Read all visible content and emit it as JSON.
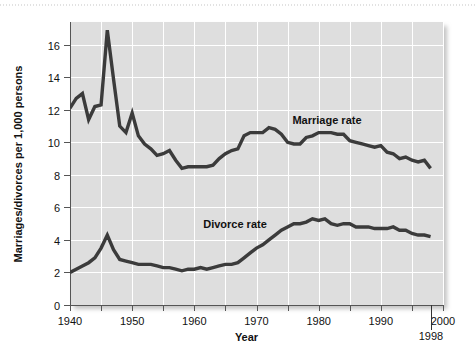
{
  "figure": {
    "background_color": "#ffffff",
    "plot_background_color": "#dedede",
    "gridline_color": "#ffffff",
    "line_color": "#3a3a3a",
    "axis_color": "#555555"
  },
  "labels": {
    "ylabel": "Marriages/divorces per 1,000 persons",
    "xlabel": "Year",
    "marriage_series_label": "Marriage rate",
    "divorce_series_label": "Divorce rate",
    "end_year_callout": "1998"
  },
  "axes": {
    "x_ticks": [
      "1940",
      "1950",
      "1960",
      "1970",
      "1980",
      "1990",
      "2000"
    ],
    "y_ticks": [
      "0",
      "2",
      "4",
      "6",
      "8",
      "10",
      "12",
      "14",
      "16"
    ],
    "x_min": 1940,
    "x_max": 2000,
    "y_min": 0,
    "y_max": 17.4,
    "x_minor_tick_step": 5,
    "y_tick_step": 2
  },
  "chart_data": {
    "type": "line",
    "title": "",
    "xlabel": "Year",
    "ylabel": "Marriages/divorces per 1,000 persons",
    "xlim": [
      1940,
      2000
    ],
    "ylim": [
      0,
      17.4
    ],
    "grid": true,
    "legend": "inline-annotations",
    "annotations": [
      {
        "text": "Marriage rate",
        "x": 1981,
        "y": 11.6
      },
      {
        "text": "Divorce rate",
        "x": 1971,
        "y": 4.9
      },
      {
        "text": "1998",
        "x": 1998,
        "y": -1.6
      }
    ],
    "series": [
      {
        "name": "Marriage rate",
        "x": [
          1940,
          1941,
          1942,
          1943,
          1944,
          1945,
          1946,
          1947,
          1948,
          1949,
          1950,
          1951,
          1952,
          1953,
          1954,
          1955,
          1956,
          1957,
          1958,
          1959,
          1960,
          1961,
          1962,
          1963,
          1964,
          1965,
          1966,
          1967,
          1968,
          1969,
          1970,
          1971,
          1972,
          1973,
          1974,
          1975,
          1976,
          1977,
          1978,
          1979,
          1980,
          1981,
          1982,
          1983,
          1984,
          1985,
          1986,
          1987,
          1988,
          1989,
          1990,
          1991,
          1992,
          1993,
          1994,
          1995,
          1996,
          1997,
          1998
        ],
        "y": [
          12.1,
          12.7,
          13.0,
          11.4,
          12.2,
          12.3,
          16.9,
          13.9,
          11.0,
          10.6,
          11.8,
          10.4,
          9.9,
          9.6,
          9.2,
          9.3,
          9.5,
          8.9,
          8.4,
          8.5,
          8.5,
          8.5,
          8.5,
          8.6,
          9.0,
          9.3,
          9.5,
          9.6,
          10.4,
          10.6,
          10.6,
          10.6,
          10.9,
          10.8,
          10.5,
          10.0,
          9.9,
          9.9,
          10.3,
          10.4,
          10.6,
          10.6,
          10.6,
          10.5,
          10.5,
          10.1,
          10.0,
          9.9,
          9.8,
          9.7,
          9.8,
          9.4,
          9.3,
          9.0,
          9.1,
          8.9,
          8.8,
          8.9,
          8.4
        ]
      },
      {
        "name": "Divorce rate",
        "x": [
          1940,
          1941,
          1942,
          1943,
          1944,
          1945,
          1946,
          1947,
          1948,
          1949,
          1950,
          1951,
          1952,
          1953,
          1954,
          1955,
          1956,
          1957,
          1958,
          1959,
          1960,
          1961,
          1962,
          1963,
          1964,
          1965,
          1966,
          1967,
          1968,
          1969,
          1970,
          1971,
          1972,
          1973,
          1974,
          1975,
          1976,
          1977,
          1978,
          1979,
          1980,
          1981,
          1982,
          1983,
          1984,
          1985,
          1986,
          1987,
          1988,
          1989,
          1990,
          1991,
          1992,
          1993,
          1994,
          1995,
          1996,
          1997,
          1998
        ],
        "y": [
          2.0,
          2.2,
          2.4,
          2.6,
          2.9,
          3.5,
          4.3,
          3.4,
          2.8,
          2.7,
          2.6,
          2.5,
          2.5,
          2.5,
          2.4,
          2.3,
          2.3,
          2.2,
          2.1,
          2.2,
          2.2,
          2.3,
          2.2,
          2.3,
          2.4,
          2.5,
          2.5,
          2.6,
          2.9,
          3.2,
          3.5,
          3.7,
          4.0,
          4.3,
          4.6,
          4.8,
          5.0,
          5.0,
          5.1,
          5.3,
          5.2,
          5.3,
          5.0,
          4.9,
          5.0,
          5.0,
          4.8,
          4.8,
          4.8,
          4.7,
          4.7,
          4.7,
          4.8,
          4.6,
          4.6,
          4.4,
          4.3,
          4.3,
          4.2
        ]
      }
    ]
  }
}
